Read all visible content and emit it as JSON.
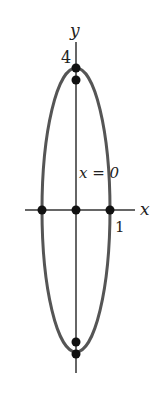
{
  "diagram": {
    "type": "ellipse-plot",
    "axes": {
      "x_label": "x",
      "y_label": "y"
    },
    "tick_labels": {
      "y_top": "4",
      "x_right": "1"
    },
    "annotation": "x = 0",
    "ellipse": {
      "center": [
        0,
        0
      ],
      "semi_axis_x": 1,
      "semi_axis_y": 4,
      "color": "#555555"
    },
    "points": [
      {
        "x": 0,
        "y": 4
      },
      {
        "x": 0,
        "y": 3.6
      },
      {
        "x": -1,
        "y": 0
      },
      {
        "x": 0,
        "y": 0
      },
      {
        "x": 1,
        "y": 0
      },
      {
        "x": 0,
        "y": -3.6
      },
      {
        "x": 0,
        "y": -4
      }
    ],
    "colors": {
      "axis": "#333333",
      "point": "#111111",
      "curve": "#555555"
    }
  }
}
